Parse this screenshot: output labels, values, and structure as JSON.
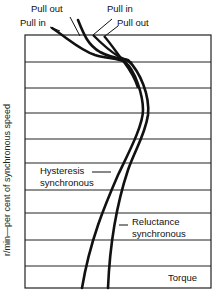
{
  "diagram": {
    "type": "torque-speed characteristic",
    "y_axis_label": "r/min—per cent of synchronous speed",
    "x_axis_label": "Torque",
    "labels": {
      "pull_out_left": "Pull out",
      "pull_in_left": "Pull in",
      "pull_in_right": "Pull in",
      "pull_out_right": "Pull out",
      "hysteresis_line1": "Hysteresis",
      "hysteresis_line2": "synchronous",
      "reluctance_line1": "Reluctance",
      "reluctance_line2": "synchronous"
    },
    "frame": {
      "left": 25,
      "top": 35,
      "right": 211,
      "bottom": 288
    },
    "gridlines_y": [
      62,
      88,
      113,
      139,
      163,
      190,
      213,
      240,
      266
    ],
    "curves": [
      {
        "name": "hysteresis-synchronous",
        "color": "#111111"
      },
      {
        "name": "reluctance-synchronous",
        "color": "#111111"
      }
    ]
  }
}
